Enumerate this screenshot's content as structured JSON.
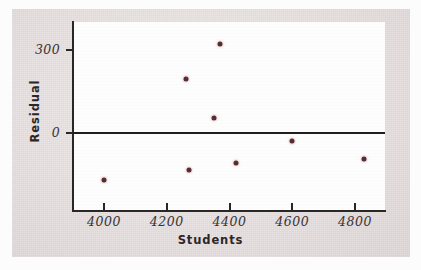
{
  "chart_data": {
    "type": "scatter",
    "title": "",
    "xlabel": "Students",
    "ylabel": "Residual",
    "xlim": [
      3900,
      4900
    ],
    "ylim": [
      -250,
      400
    ],
    "grid": false,
    "legend": null,
    "xticks": [
      4000,
      4200,
      4400,
      4600,
      4800
    ],
    "xtick_labels": [
      "4000",
      "4200",
      "4400",
      "4600",
      "4800"
    ],
    "yticks": [
      0,
      300
    ],
    "ytick_labels": [
      "0",
      "300"
    ],
    "reference_lines": [
      {
        "orientation": "horizontal",
        "value": 0,
        "style": "solid-heavy"
      }
    ],
    "marker_color": "#5b2b33",
    "points": [
      {
        "x": 4000,
        "y": -170
      },
      {
        "x": 4260,
        "y": 195
      },
      {
        "x": 4270,
        "y": -135
      },
      {
        "x": 4350,
        "y": 55
      },
      {
        "x": 4370,
        "y": 320
      },
      {
        "x": 4420,
        "y": -110
      },
      {
        "x": 4600,
        "y": -30
      },
      {
        "x": 4830,
        "y": -95
      }
    ]
  },
  "figure": {
    "background_color": "#e4dddc",
    "plot_background_color": "#fefdfd",
    "axis_color": "#2b2626",
    "tick_label_color": "#3a3333"
  }
}
